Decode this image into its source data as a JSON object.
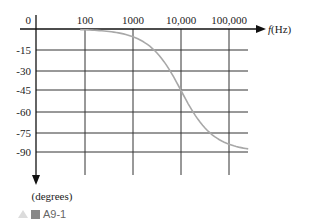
{
  "chart_data": {
    "type": "line",
    "title": "",
    "xlabel": "f(Hz)",
    "ylabel": "(degrees)",
    "x_scale": "log",
    "x_ticks": [
      "100",
      "1000",
      "10,000",
      "100,000"
    ],
    "y_ticks": [
      "0",
      "-15",
      "-30",
      "-45",
      "-60",
      "-75",
      "-90"
    ],
    "xlim": [
      10,
      200000
    ],
    "ylim": [
      -90,
      0
    ],
    "grid": true,
    "series": [
      {
        "name": "phase",
        "color": "#a8a8a8",
        "x": [
          100,
          300,
          1000,
          2000,
          5000,
          10000,
          20000,
          50000,
          100000,
          200000
        ],
        "values": [
          -0.6,
          -1.7,
          -5.7,
          -11.3,
          -26.6,
          -45,
          -63.4,
          -78.7,
          -84.3,
          -87.1
        ]
      }
    ]
  },
  "labels": {
    "origin": "0",
    "x_unit_italic": "f",
    "x_unit": "(Hz)",
    "y_unit": "(degrees)"
  },
  "caption": {
    "text": "A9-1"
  }
}
